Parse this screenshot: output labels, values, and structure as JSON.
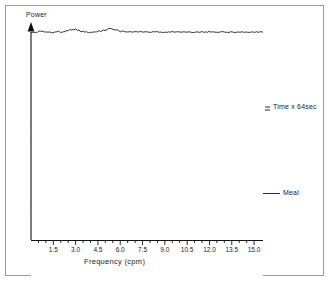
{
  "figure": {
    "kind": "waterfall-spectral-plot",
    "ylabel": "Power",
    "xlabel": "Frequency (cpm)",
    "annotations": {
      "time": "Time x 64sec",
      "meal": "Meal"
    },
    "colors": {
      "trace": "#111111",
      "axis": "#111111",
      "border": "#9a9a9a",
      "background": "#ffffff"
    }
  },
  "chart_data": {
    "type": "line",
    "title": "",
    "xlabel": "Frequency (cpm)",
    "ylabel": "Power",
    "xlim": [
      0.0,
      15.6
    ],
    "ylim": [
      0,
      70
    ],
    "grid": false,
    "legend": null,
    "xticks": [
      "1.5",
      "3.0",
      "4.5",
      "6.0",
      "7.5",
      "9.0",
      "10.5",
      "12.0",
      "13.5",
      "15.0"
    ],
    "xtick_values": [
      1.5,
      3.0,
      4.5,
      6.0,
      7.5,
      9.0,
      10.5,
      12.0,
      13.5,
      15.0
    ],
    "yticks": [],
    "n_traces": 70,
    "trace_label": "Time x 64sec",
    "meal_trace_index": 18,
    "annotations": [
      {
        "text": "Time x 64sec",
        "trace_index": 46
      },
      {
        "text": "Meal",
        "trace_index": 18
      }
    ],
    "series": [
      {
        "name": "trace-0",
        "peaks": [
          {
            "f": 9.8,
            "a": 3
          }
        ]
      },
      {
        "name": "trace-1",
        "peaks": [
          {
            "f": 9.9,
            "a": 4
          },
          {
            "f": 3.0,
            "a": 2
          }
        ]
      },
      {
        "name": "trace-2",
        "peaks": [
          {
            "f": 9.7,
            "a": 3
          }
        ]
      },
      {
        "name": "trace-3",
        "peaks": [
          {
            "f": 2.9,
            "a": 3
          }
        ]
      },
      {
        "name": "trace-4",
        "peaks": [
          {
            "f": 3.0,
            "a": 3
          }
        ]
      },
      {
        "name": "trace-5",
        "peaks": [
          {
            "f": 2.8,
            "a": 2
          }
        ]
      },
      {
        "name": "trace-6",
        "peaks": [
          {
            "f": 3.0,
            "a": 3
          }
        ]
      },
      {
        "name": "trace-7",
        "peaks": [
          {
            "f": 2.9,
            "a": 3
          }
        ]
      },
      {
        "name": "trace-8",
        "peaks": [
          {
            "f": 3.1,
            "a": 4
          }
        ]
      },
      {
        "name": "trace-9",
        "peaks": [
          {
            "f": 3.0,
            "a": 3
          }
        ]
      },
      {
        "name": "trace-10",
        "peaks": [
          {
            "f": 2.9,
            "a": 3
          }
        ]
      },
      {
        "name": "trace-11",
        "peaks": [
          {
            "f": 3.0,
            "a": 4
          }
        ]
      },
      {
        "name": "trace-12",
        "peaks": [
          {
            "f": 3.0,
            "a": 3
          }
        ]
      },
      {
        "name": "trace-13",
        "peaks": [
          {
            "f": 2.9,
            "a": 3
          }
        ]
      },
      {
        "name": "trace-14",
        "peaks": [
          {
            "f": 3.0,
            "a": 4
          }
        ]
      },
      {
        "name": "trace-15",
        "peaks": [
          {
            "f": 3.0,
            "a": 3
          }
        ]
      },
      {
        "name": "trace-16",
        "peaks": [
          {
            "f": 2.9,
            "a": 4
          }
        ]
      },
      {
        "name": "trace-17",
        "peaks": [
          {
            "f": 3.0,
            "a": 5
          }
        ]
      },
      {
        "name": "trace-18",
        "peaks": [
          {
            "f": 2.8,
            "a": 9
          },
          {
            "f": 5.6,
            "a": 5
          }
        ]
      },
      {
        "name": "trace-19",
        "peaks": [
          {
            "f": 2.9,
            "a": 11
          },
          {
            "f": 5.7,
            "a": 6
          }
        ]
      },
      {
        "name": "trace-20",
        "peaks": [
          {
            "f": 2.9,
            "a": 10
          },
          {
            "f": 5.6,
            "a": 7
          }
        ]
      },
      {
        "name": "trace-21",
        "peaks": [
          {
            "f": 3.0,
            "a": 9
          },
          {
            "f": 5.5,
            "a": 6
          }
        ]
      },
      {
        "name": "trace-22",
        "peaks": [
          {
            "f": 2.9,
            "a": 11
          },
          {
            "f": 5.7,
            "a": 8
          }
        ]
      },
      {
        "name": "trace-23",
        "peaks": [
          {
            "f": 3.0,
            "a": 12
          },
          {
            "f": 5.6,
            "a": 7
          }
        ]
      },
      {
        "name": "trace-24",
        "peaks": [
          {
            "f": 2.9,
            "a": 13
          },
          {
            "f": 5.8,
            "a": 6
          }
        ]
      },
      {
        "name": "trace-25",
        "peaks": [
          {
            "f": 3.0,
            "a": 11
          },
          {
            "f": 5.6,
            "a": 8
          }
        ]
      },
      {
        "name": "trace-26",
        "peaks": [
          {
            "f": 2.8,
            "a": 14
          },
          {
            "f": 5.5,
            "a": 7
          }
        ]
      },
      {
        "name": "trace-27",
        "peaks": [
          {
            "f": 2.9,
            "a": 13
          },
          {
            "f": 5.7,
            "a": 9
          }
        ]
      },
      {
        "name": "trace-28",
        "peaks": [
          {
            "f": 3.0,
            "a": 15
          },
          {
            "f": 5.6,
            "a": 7
          }
        ]
      },
      {
        "name": "trace-29",
        "peaks": [
          {
            "f": 2.9,
            "a": 14
          },
          {
            "f": 5.8,
            "a": 8
          }
        ]
      },
      {
        "name": "trace-30",
        "peaks": [
          {
            "f": 2.9,
            "a": 16
          },
          {
            "f": 5.6,
            "a": 9
          }
        ]
      },
      {
        "name": "trace-31",
        "peaks": [
          {
            "f": 3.0,
            "a": 14
          },
          {
            "f": 5.5,
            "a": 8
          }
        ]
      },
      {
        "name": "trace-32",
        "peaks": [
          {
            "f": 2.8,
            "a": 15
          },
          {
            "f": 5.7,
            "a": 10
          }
        ]
      },
      {
        "name": "trace-33",
        "peaks": [
          {
            "f": 2.9,
            "a": 17
          },
          {
            "f": 5.6,
            "a": 9
          }
        ]
      },
      {
        "name": "trace-34",
        "peaks": [
          {
            "f": 3.0,
            "a": 15
          },
          {
            "f": 5.8,
            "a": 8
          }
        ]
      },
      {
        "name": "trace-35",
        "peaks": [
          {
            "f": 2.9,
            "a": 16
          },
          {
            "f": 5.6,
            "a": 10
          }
        ]
      },
      {
        "name": "trace-36",
        "peaks": [
          {
            "f": 2.9,
            "a": 18
          },
          {
            "f": 5.5,
            "a": 9
          }
        ]
      },
      {
        "name": "trace-37",
        "peaks": [
          {
            "f": 3.0,
            "a": 16
          },
          {
            "f": 5.7,
            "a": 8
          }
        ]
      },
      {
        "name": "trace-38",
        "peaks": [
          {
            "f": 2.8,
            "a": 15
          },
          {
            "f": 5.6,
            "a": 9
          }
        ]
      },
      {
        "name": "trace-39",
        "peaks": [
          {
            "f": 2.9,
            "a": 14
          },
          {
            "f": 5.8,
            "a": 7
          }
        ]
      },
      {
        "name": "trace-40",
        "peaks": [
          {
            "f": 3.0,
            "a": 13
          },
          {
            "f": 5.6,
            "a": 8
          }
        ]
      },
      {
        "name": "trace-41",
        "peaks": [
          {
            "f": 2.9,
            "a": 12
          },
          {
            "f": 5.5,
            "a": 7
          }
        ]
      },
      {
        "name": "trace-42",
        "peaks": [
          {
            "f": 2.9,
            "a": 13
          },
          {
            "f": 5.7,
            "a": 6
          }
        ]
      },
      {
        "name": "trace-43",
        "peaks": [
          {
            "f": 3.0,
            "a": 11
          },
          {
            "f": 5.6,
            "a": 7
          }
        ]
      },
      {
        "name": "trace-44",
        "peaks": [
          {
            "f": 2.8,
            "a": 12
          },
          {
            "f": 5.4,
            "a": 6
          }
        ]
      },
      {
        "name": "trace-45",
        "peaks": [
          {
            "f": 2.9,
            "a": 10
          },
          {
            "f": 5.5,
            "a": 5
          }
        ]
      },
      {
        "name": "trace-46",
        "peaks": [
          {
            "f": 3.0,
            "a": 11
          },
          {
            "f": 5.3,
            "a": 6
          }
        ]
      },
      {
        "name": "trace-47",
        "peaks": [
          {
            "f": 2.9,
            "a": 9
          },
          {
            "f": 5.4,
            "a": 5
          }
        ]
      },
      {
        "name": "trace-48",
        "peaks": [
          {
            "f": 2.9,
            "a": 10
          },
          {
            "f": 5.2,
            "a": 4
          }
        ]
      },
      {
        "name": "trace-49",
        "peaks": [
          {
            "f": 3.0,
            "a": 8
          },
          {
            "f": 5.3,
            "a": 5
          }
        ]
      },
      {
        "name": "trace-50",
        "peaks": [
          {
            "f": 2.8,
            "a": 9
          },
          {
            "f": 5.1,
            "a": 4
          }
        ]
      },
      {
        "name": "trace-51",
        "peaks": [
          {
            "f": 2.9,
            "a": 8
          },
          {
            "f": 5.2,
            "a": 5
          }
        ]
      },
      {
        "name": "trace-52",
        "peaks": [
          {
            "f": 3.0,
            "a": 9
          },
          {
            "f": 5.0,
            "a": 4
          }
        ]
      },
      {
        "name": "trace-53",
        "peaks": [
          {
            "f": 2.9,
            "a": 7
          },
          {
            "f": 5.1,
            "a": 3
          }
        ]
      },
      {
        "name": "trace-54",
        "peaks": [
          {
            "f": 2.8,
            "a": 8
          },
          {
            "f": 4.9,
            "a": 4
          }
        ]
      },
      {
        "name": "trace-55",
        "peaks": [
          {
            "f": 2.9,
            "a": 7
          },
          {
            "f": 5.0,
            "a": 3
          }
        ]
      },
      {
        "name": "trace-56",
        "peaks": [
          {
            "f": 3.0,
            "a": 6
          },
          {
            "f": 4.8,
            "a": 4
          }
        ]
      },
      {
        "name": "trace-57",
        "peaks": [
          {
            "f": 2.9,
            "a": 7
          },
          {
            "f": 4.9,
            "a": 3
          }
        ]
      },
      {
        "name": "trace-58",
        "peaks": [
          {
            "f": 2.8,
            "a": 6
          },
          {
            "f": 4.7,
            "a": 3
          }
        ]
      },
      {
        "name": "trace-59",
        "peaks": [
          {
            "f": 2.9,
            "a": 5
          },
          {
            "f": 4.8,
            "a": 4
          }
        ]
      },
      {
        "name": "trace-60",
        "peaks": [
          {
            "f": 3.0,
            "a": 6
          },
          {
            "f": 4.6,
            "a": 3
          }
        ]
      },
      {
        "name": "trace-61",
        "peaks": [
          {
            "f": 2.9,
            "a": 5
          },
          {
            "f": 4.7,
            "a": 3
          }
        ]
      },
      {
        "name": "trace-62",
        "peaks": [
          {
            "f": 2.8,
            "a": 6
          },
          {
            "f": 4.5,
            "a": 4
          }
        ]
      },
      {
        "name": "trace-63",
        "peaks": [
          {
            "f": 2.9,
            "a": 5
          },
          {
            "f": 4.9,
            "a": 5
          }
        ]
      },
      {
        "name": "trace-64",
        "peaks": [
          {
            "f": 3.0,
            "a": 6
          },
          {
            "f": 5.1,
            "a": 4
          }
        ]
      },
      {
        "name": "trace-65",
        "peaks": [
          {
            "f": 2.9,
            "a": 5
          },
          {
            "f": 5.0,
            "a": 5
          }
        ]
      },
      {
        "name": "trace-66",
        "peaks": [
          {
            "f": 2.8,
            "a": 4
          },
          {
            "f": 5.2,
            "a": 4
          }
        ]
      },
      {
        "name": "trace-67",
        "peaks": [
          {
            "f": 2.9,
            "a": 5
          },
          {
            "f": 5.3,
            "a": 5
          }
        ]
      },
      {
        "name": "trace-68",
        "peaks": [
          {
            "f": 3.0,
            "a": 4
          },
          {
            "f": 5.1,
            "a": 4
          }
        ]
      },
      {
        "name": "trace-69",
        "peaks": [
          {
            "f": 2.9,
            "a": 3
          },
          {
            "f": 5.4,
            "a": 3
          }
        ]
      }
    ]
  }
}
